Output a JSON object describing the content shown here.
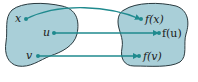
{
  "diagram": {
    "type": "function-mapping",
    "domain_set": {
      "points": [
        {
          "label": "x"
        },
        {
          "label": "u"
        },
        {
          "label": "v"
        }
      ]
    },
    "codomain_set": {
      "points": [
        {
          "label": "f(x)"
        },
        {
          "label": "f(u)"
        },
        {
          "label": "f(v)"
        }
      ]
    },
    "mappings": [
      {
        "from": "x",
        "to": "f(x)"
      },
      {
        "from": "u",
        "to": "f(u)"
      },
      {
        "from": "v",
        "to": "f(v)"
      }
    ],
    "colors": {
      "blob_fill": "#a9cfd8",
      "blob_stroke": "#2a3a3f",
      "arrow": "#1f8a8e",
      "point": "#1f8a8e"
    }
  }
}
